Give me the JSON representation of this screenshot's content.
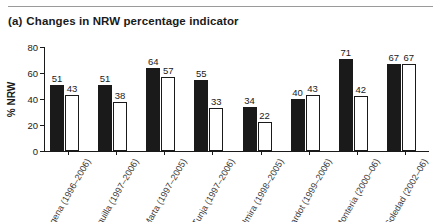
{
  "caption": {
    "label": "(a)",
    "text": "Changes in NRW percentage indicator"
  },
  "axes": {
    "ylabel": "% NRW",
    "yticks": [
      0,
      20,
      40,
      60,
      80
    ],
    "ylim": [
      0,
      80
    ]
  },
  "legend": {
    "before_name": "before",
    "after_name": "after"
  },
  "colors": {
    "before": "#1a1a1a",
    "after": "#ffffff",
    "axis": "#1a1a1a",
    "rule": "#9a9a9a",
    "text": "#1a1a1a"
  },
  "chart_data": {
    "type": "bar",
    "title": "Changes in NRW percentage indicator",
    "xlabel": "",
    "ylabel": "% NRW",
    "ylim": [
      0,
      80
    ],
    "grid": false,
    "legend_position": "none",
    "categories": [
      "Cartagena (1996–2006)",
      "Barranquilla (1997–2006)",
      "Santa Marta (1997–2005)",
      "Tunja (1997–2006)",
      "Palmira (1998–2005)",
      "Girardot (1999–2006)",
      "Monteria (2000–06)",
      "Soledad (2002–06)"
    ],
    "series": [
      {
        "name": "before",
        "values": [
          51,
          51,
          64,
          55,
          34,
          40,
          71,
          67
        ]
      },
      {
        "name": "after",
        "values": [
          43,
          38,
          57,
          33,
          22,
          43,
          42,
          67
        ]
      }
    ]
  }
}
